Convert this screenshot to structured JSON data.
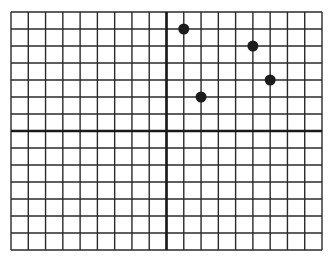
{
  "grid": {
    "x_min": -9,
    "x_max": 9,
    "y_min": -7,
    "y_max": 7,
    "left_px": 11,
    "top_px": 12,
    "right_px": 322,
    "bottom_px": 250,
    "line_color": "#2a2a2a",
    "axis_color": "#1a1a1a",
    "point_color": "#1c1c1c"
  },
  "points": [
    {
      "x": 1,
      "y": 6
    },
    {
      "x": 5,
      "y": 5
    },
    {
      "x": 6,
      "y": 3
    },
    {
      "x": 2,
      "y": 2
    }
  ]
}
